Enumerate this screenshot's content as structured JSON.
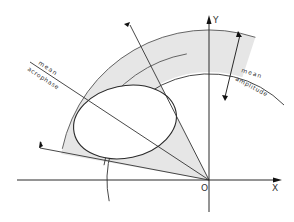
{
  "diagram": {
    "type": "cosinor polar plot",
    "axes": {
      "x_label": "X",
      "y_label": "Y",
      "origin_label": "O"
    },
    "labels": {
      "mean_acrophase_line1": "mean",
      "mean_acrophase_line2": "acrophase",
      "mean_amplitude_line1": "mean",
      "mean_amplitude_line2": "amplitude"
    },
    "colors": {
      "line": "#2a2a2a",
      "band_fill": "#e6e6e6",
      "ellipse_fill": "#ffffff",
      "background": "#ffffff"
    }
  }
}
